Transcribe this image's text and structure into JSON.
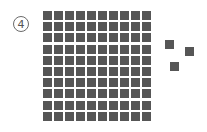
{
  "label": {
    "number": "4"
  },
  "grid": {
    "rows": 10,
    "cols": 10,
    "count": 100,
    "color": "#565656"
  },
  "loose_squares": [
    {
      "x": 165,
      "y": 40
    },
    {
      "x": 185,
      "y": 47
    },
    {
      "x": 170,
      "y": 62
    }
  ],
  "total_squares": 103
}
